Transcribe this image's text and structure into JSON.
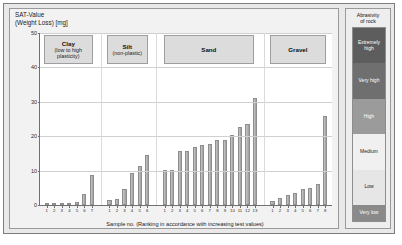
{
  "chart_data": {
    "type": "bar",
    "title": "SAT-Value\n(Weight Loss)   [mg]",
    "ylabel": "SAT-Value (Weight Loss) [mg]",
    "xlabel": "Sample no. (Ranking in accordance with increasing test values)",
    "ylim": [
      0,
      50
    ],
    "yticks": [
      0,
      10,
      20,
      30,
      40,
      50
    ],
    "grid": true,
    "legend_position": "right",
    "groups": [
      {
        "name": "Clay",
        "subtitle": "(low to high\nplasticity)",
        "categories": [
          "1",
          "2",
          "3",
          "4",
          "5",
          "6",
          "7"
        ],
        "values": [
          0.4,
          0.5,
          0.6,
          0.7,
          0.9,
          3.2,
          8.6
        ]
      },
      {
        "name": "Silt",
        "subtitle": "(non-plastic)",
        "categories": [
          "1",
          "2",
          "3",
          "4",
          "5",
          "6"
        ],
        "values": [
          1.6,
          1.8,
          4.8,
          9.2,
          11.4,
          14.4
        ]
      },
      {
        "name": "Sand",
        "subtitle": "",
        "categories": [
          "1",
          "2",
          "3",
          "4",
          "5",
          "6",
          "7",
          "8",
          "9",
          "10",
          "11",
          "12",
          "13"
        ],
        "values": [
          10.2,
          10.3,
          15.8,
          15.6,
          17.0,
          17.4,
          17.6,
          18.8,
          19.0,
          20.4,
          22.6,
          23.6,
          31.2
        ]
      },
      {
        "name": "Gravel",
        "subtitle": "",
        "categories": [
          "1",
          "2",
          "3",
          "4",
          "5",
          "6",
          "7",
          "8"
        ],
        "values": [
          1.2,
          2.0,
          2.8,
          3.6,
          4.6,
          5.0,
          6.0,
          26.0
        ]
      }
    ]
  },
  "legend": {
    "title": "Abrasivity\nof rock",
    "items": [
      {
        "label": "Extremely\nhigh",
        "color": "#5d5d5d",
        "text_color": "#ffffff",
        "weight": 1.0
      },
      {
        "label": "Very high",
        "color": "#6f6f6f",
        "text_color": "#ffffff",
        "weight": 1.0
      },
      {
        "label": "High",
        "color": "#9b9b9b",
        "text_color": "#ffffff",
        "weight": 1.0
      },
      {
        "label": "Medium",
        "color": "#f0f0f0",
        "text_color": "#1a1a1a",
        "weight": 1.0
      },
      {
        "label": "Low",
        "color": "#e6e6e6",
        "text_color": "#1a1a1a",
        "weight": 1.0
      },
      {
        "label": "Very low",
        "color": "#8a8a8a",
        "text_color": "#ffffff",
        "weight": 0.45
      }
    ]
  }
}
